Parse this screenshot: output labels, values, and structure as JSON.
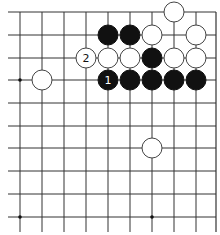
{
  "board": {
    "grid_color": "#333333",
    "black_color": "#111111",
    "white_color": "#ffffff",
    "stone_outline": "#444444",
    "cols_x": [
      20,
      42,
      64,
      86,
      108,
      130,
      152,
      174,
      196
    ],
    "rows_y": [
      12,
      35,
      58,
      80,
      103,
      126,
      148,
      171,
      194,
      217
    ],
    "right_edge_x": 216,
    "stone_radius": 10,
    "star_points": [
      [
        0,
        3
      ],
      [
        0,
        9
      ],
      [
        6,
        9
      ]
    ],
    "stones": [
      {
        "col": 7,
        "row": 0,
        "color": "white",
        "label": ""
      },
      {
        "col": 4,
        "row": 1,
        "color": "black",
        "label": ""
      },
      {
        "col": 5,
        "row": 1,
        "color": "black",
        "label": ""
      },
      {
        "col": 6,
        "row": 1,
        "color": "white",
        "label": ""
      },
      {
        "col": 8,
        "row": 1,
        "color": "white",
        "label": ""
      },
      {
        "col": 3,
        "row": 2,
        "color": "white",
        "label": "2"
      },
      {
        "col": 4,
        "row": 2,
        "color": "white",
        "label": ""
      },
      {
        "col": 5,
        "row": 2,
        "color": "white",
        "label": ""
      },
      {
        "col": 6,
        "row": 2,
        "color": "black",
        "label": ""
      },
      {
        "col": 7,
        "row": 2,
        "color": "white",
        "label": ""
      },
      {
        "col": 8,
        "row": 2,
        "color": "white",
        "label": ""
      },
      {
        "col": 1,
        "row": 3,
        "color": "white",
        "label": ""
      },
      {
        "col": 4,
        "row": 3,
        "color": "black",
        "label": "1"
      },
      {
        "col": 5,
        "row": 3,
        "color": "black",
        "label": ""
      },
      {
        "col": 6,
        "row": 3,
        "color": "black",
        "label": ""
      },
      {
        "col": 7,
        "row": 3,
        "color": "black",
        "label": ""
      },
      {
        "col": 8,
        "row": 3,
        "color": "black",
        "label": ""
      },
      {
        "col": 6,
        "row": 6,
        "color": "white",
        "label": ""
      }
    ]
  }
}
